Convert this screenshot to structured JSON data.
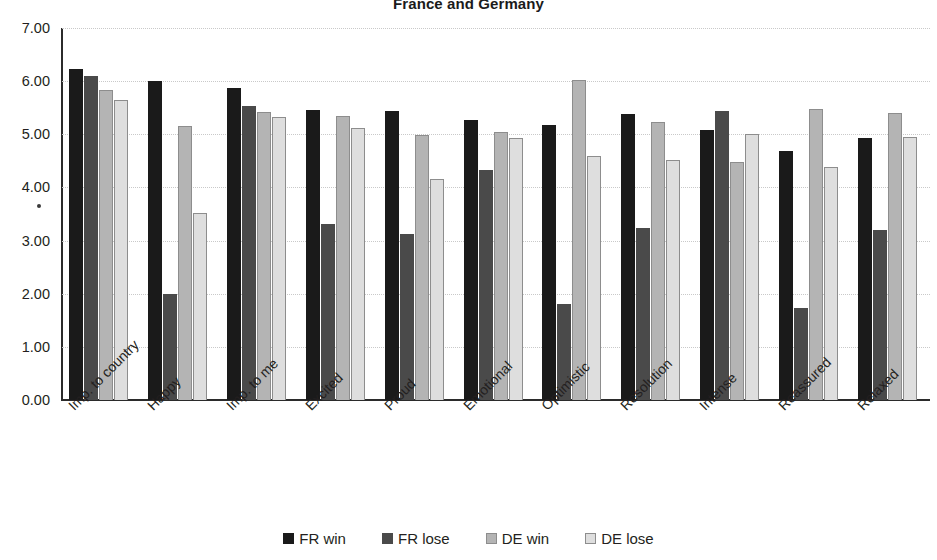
{
  "chart_data": {
    "type": "bar",
    "title": "France and Germany",
    "xlabel": "",
    "ylabel": "",
    "ylim": [
      0,
      7
    ],
    "ytick_step": 1,
    "ytick_labels": [
      "7.00",
      "6.00",
      "5.00",
      "4.00",
      "3.00",
      "2.00",
      "1.00",
      "0.00"
    ],
    "grid": true,
    "legend_position": "bottom",
    "categories": [
      "Imp. to country",
      "Happy",
      "Imp. to me",
      "Excited",
      "Proud",
      "Emotional",
      "Optimistic",
      "Resolution",
      "Intense",
      "Reassured",
      "Relaxed"
    ],
    "series": [
      {
        "name": "FR win",
        "color": "#1a1a1a",
        "values": [
          6.22,
          6.01,
          5.87,
          5.45,
          5.44,
          5.26,
          5.17,
          5.39,
          5.09,
          4.68,
          4.93
        ]
      },
      {
        "name": "FR lose",
        "color": "#4a4a4a",
        "values": [
          6.1,
          2.0,
          5.54,
          3.32,
          3.12,
          4.32,
          1.8,
          3.24,
          5.44,
          1.74,
          3.19
        ]
      },
      {
        "name": "DE win",
        "color": "#b4b4b4",
        "values": [
          5.83,
          5.15,
          5.42,
          5.35,
          4.99,
          5.05,
          6.02,
          5.24,
          4.47,
          5.47,
          5.4
        ]
      },
      {
        "name": "DE lose",
        "color": "#dedede",
        "values": [
          5.65,
          3.51,
          5.33,
          5.12,
          4.16,
          4.93,
          4.6,
          4.52,
          5.0,
          4.38,
          4.94
        ]
      }
    ]
  }
}
